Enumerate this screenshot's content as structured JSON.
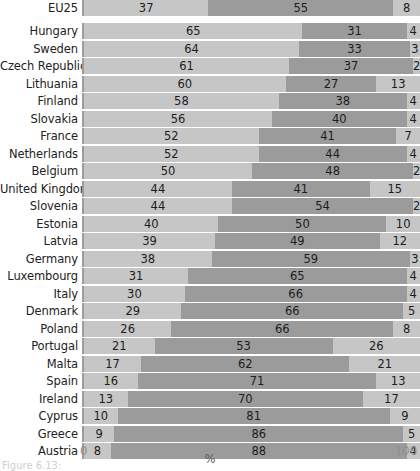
{
  "chart_data": {
    "type": "bar",
    "subtype": "horizontal-stacked-100",
    "title": "",
    "xlabel": "%",
    "ylabel": "",
    "xlim": [
      0,
      100
    ],
    "xticks": [
      "0",
      "100"
    ],
    "grid": false,
    "legend": null,
    "series": [
      {
        "name": "segment-1",
        "color": "#c6c6c6"
      },
      {
        "name": "segment-2",
        "color": "#9b9b9b"
      },
      {
        "name": "segment-3",
        "color": "#c6c6c6"
      }
    ],
    "categories": [
      "EU25",
      "Hungary",
      "Sweden",
      "Czech Republic",
      "Lithuania",
      "Finland",
      "Slovakia",
      "France",
      "Netherlands",
      "Belgium",
      "United Kingdom",
      "Slovenia",
      "Estonia",
      "Latvia",
      "Germany",
      "Luxembourg",
      "Italy",
      "Denmark",
      "Poland",
      "Portugal",
      "Malta",
      "Spain",
      "Ireland",
      "Cyprus",
      "Greece",
      "Austria"
    ],
    "rows": [
      {
        "category": "EU25",
        "values": [
          37,
          55,
          8
        ],
        "separated": true
      },
      {
        "category": "Hungary",
        "values": [
          65,
          31,
          4
        ]
      },
      {
        "category": "Sweden",
        "values": [
          64,
          33,
          3
        ]
      },
      {
        "category": "Czech Republic",
        "values": [
          61,
          37,
          2
        ]
      },
      {
        "category": "Lithuania",
        "values": [
          60,
          27,
          13
        ]
      },
      {
        "category": "Finland",
        "values": [
          58,
          38,
          4
        ]
      },
      {
        "category": "Slovakia",
        "values": [
          56,
          40,
          4
        ]
      },
      {
        "category": "France",
        "values": [
          52,
          41,
          7
        ]
      },
      {
        "category": "Netherlands",
        "values": [
          52,
          44,
          4
        ]
      },
      {
        "category": "Belgium",
        "values": [
          50,
          48,
          2
        ]
      },
      {
        "category": "United Kingdom",
        "values": [
          44,
          41,
          15
        ]
      },
      {
        "category": "Slovenia",
        "values": [
          44,
          54,
          2
        ]
      },
      {
        "category": "Estonia",
        "values": [
          40,
          50,
          10
        ]
      },
      {
        "category": "Latvia",
        "values": [
          39,
          49,
          12
        ]
      },
      {
        "category": "Germany",
        "values": [
          38,
          59,
          3
        ]
      },
      {
        "category": "Luxembourg",
        "values": [
          31,
          65,
          4
        ]
      },
      {
        "category": "Italy",
        "values": [
          30,
          66,
          4
        ]
      },
      {
        "category": "Denmark",
        "values": [
          29,
          66,
          5
        ]
      },
      {
        "category": "Poland",
        "values": [
          26,
          66,
          8
        ]
      },
      {
        "category": "Portugal",
        "values": [
          21,
          53,
          26
        ]
      },
      {
        "category": "Malta",
        "values": [
          17,
          62,
          21
        ]
      },
      {
        "category": "Spain",
        "values": [
          16,
          71,
          13
        ]
      },
      {
        "category": "Ireland",
        "values": [
          13,
          70,
          17
        ]
      },
      {
        "category": "Cyprus",
        "values": [
          10,
          81,
          9
        ]
      },
      {
        "category": "Greece",
        "values": [
          9,
          86,
          5
        ]
      },
      {
        "category": "Austria",
        "values": [
          8,
          88,
          4
        ]
      }
    ]
  },
  "axis": {
    "x_min_label": "0",
    "x_max_label": "100",
    "x_title": "%"
  },
  "caption": "Figure 6.13:"
}
